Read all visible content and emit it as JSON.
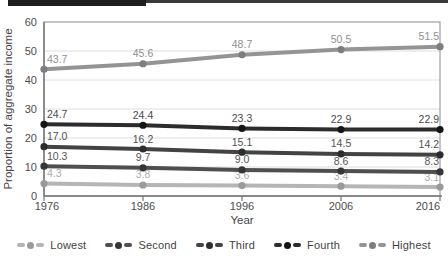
{
  "header": {
    "left_bar_color": "#1f1f1f",
    "right_bar_color": "#383838"
  },
  "chart_data": {
    "type": "line",
    "title": "",
    "xlabel": "Year",
    "ylabel": "Proportion of aggregate income",
    "x": [
      "1976",
      "1986",
      "1996",
      "2006",
      "2016"
    ],
    "ylim": [
      0,
      60
    ],
    "yticks": [
      0,
      10,
      20,
      30,
      40,
      50,
      60
    ],
    "grid": true,
    "legend_position": "bottom",
    "series": [
      {
        "name": "Lowest",
        "line_color": "#b5b5b5",
        "marker_color": "#9a9a9a",
        "label_color": "#ababab",
        "values": [
          4.3,
          3.8,
          3.6,
          3.4,
          3.1
        ]
      },
      {
        "name": "Second",
        "line_color": "#4f4f4f",
        "marker_color": "#363636",
        "label_color": "#555555",
        "values": [
          10.3,
          9.7,
          9.0,
          8.6,
          8.3
        ]
      },
      {
        "name": "Third",
        "line_color": "#434343",
        "marker_color": "#2d2d2d",
        "label_color": "#515151",
        "values": [
          17.0,
          16.2,
          15.1,
          14.5,
          14.2
        ]
      },
      {
        "name": "Fourth",
        "line_color": "#2c2c2c",
        "marker_color": "#151515",
        "label_color": "#4a4a4a",
        "values": [
          24.7,
          24.4,
          23.3,
          22.9,
          22.9
        ]
      },
      {
        "name": "Highest",
        "line_color": "#949494",
        "marker_color": "#7d7d7d",
        "label_color": "#8f8f8f",
        "values": [
          43.7,
          45.6,
          48.7,
          50.5,
          51.5
        ]
      }
    ],
    "axis_style": {
      "frame_color": "#9e9e9e",
      "grid_color": "#dedede",
      "axis_line_color": "#757575",
      "tick_label_color": "#4d4d4d",
      "axis_title_color": "#444444"
    }
  }
}
